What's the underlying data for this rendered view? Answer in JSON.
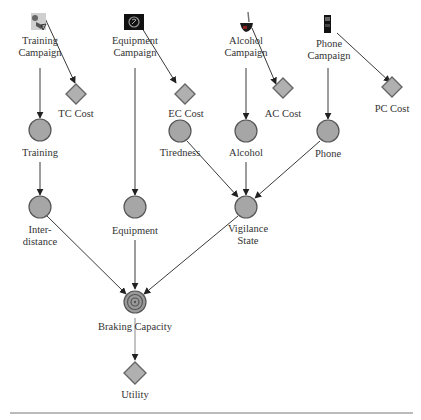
{
  "diagram": {
    "type": "influence-diagram",
    "decision_nodes": [
      {
        "id": "tc",
        "label_lines": [
          "Training",
          "Campaign"
        ],
        "icon": "training-icon"
      },
      {
        "id": "ec",
        "label_lines": [
          "Equipment",
          "Campaign"
        ],
        "icon": "equipment-icon"
      },
      {
        "id": "ac",
        "label_lines": [
          "Alcohol",
          "Campaign"
        ],
        "icon": "alcohol-glass-icon"
      },
      {
        "id": "pc",
        "label_lines": [
          "Phone",
          "Campaign"
        ],
        "icon": "mobile-phone-icon"
      }
    ],
    "cost_nodes": [
      {
        "id": "tc_cost",
        "label": "TC Cost"
      },
      {
        "id": "ec_cost",
        "label": "EC Cost"
      },
      {
        "id": "ac_cost",
        "label": "AC Cost"
      },
      {
        "id": "pc_cost",
        "label": "PC Cost"
      }
    ],
    "chance_nodes": [
      {
        "id": "training",
        "label_lines": [
          "Training"
        ]
      },
      {
        "id": "tiredness",
        "label_lines": [
          "Tiredness"
        ]
      },
      {
        "id": "alcohol",
        "label_lines": [
          "Alcohol"
        ]
      },
      {
        "id": "phone",
        "label_lines": [
          "Phone"
        ]
      },
      {
        "id": "interdistance",
        "label_lines": [
          "Inter-",
          "distance"
        ]
      },
      {
        "id": "equipment",
        "label_lines": [
          "Equipment"
        ]
      },
      {
        "id": "vigilance",
        "label_lines": [
          "Vigilance",
          "State"
        ]
      }
    ],
    "target_node": {
      "id": "braking",
      "label": "Braking Capacity"
    },
    "utility_node": {
      "id": "utility",
      "label": "Utility"
    },
    "edges": [
      [
        "tc",
        "tc_cost"
      ],
      [
        "ec",
        "ec_cost"
      ],
      [
        "ac",
        "ac_cost"
      ],
      [
        "pc",
        "pc_cost"
      ],
      [
        "tc",
        "training"
      ],
      [
        "training",
        "interdistance"
      ],
      [
        "ec",
        "equipment"
      ],
      [
        "ac",
        "alcohol"
      ],
      [
        "pc",
        "phone"
      ],
      [
        "tiredness",
        "vigilance"
      ],
      [
        "alcohol",
        "vigilance"
      ],
      [
        "phone",
        "vigilance"
      ],
      [
        "interdistance",
        "braking"
      ],
      [
        "equipment",
        "braking"
      ],
      [
        "vigilance",
        "braking"
      ],
      [
        "braking",
        "utility"
      ]
    ]
  }
}
